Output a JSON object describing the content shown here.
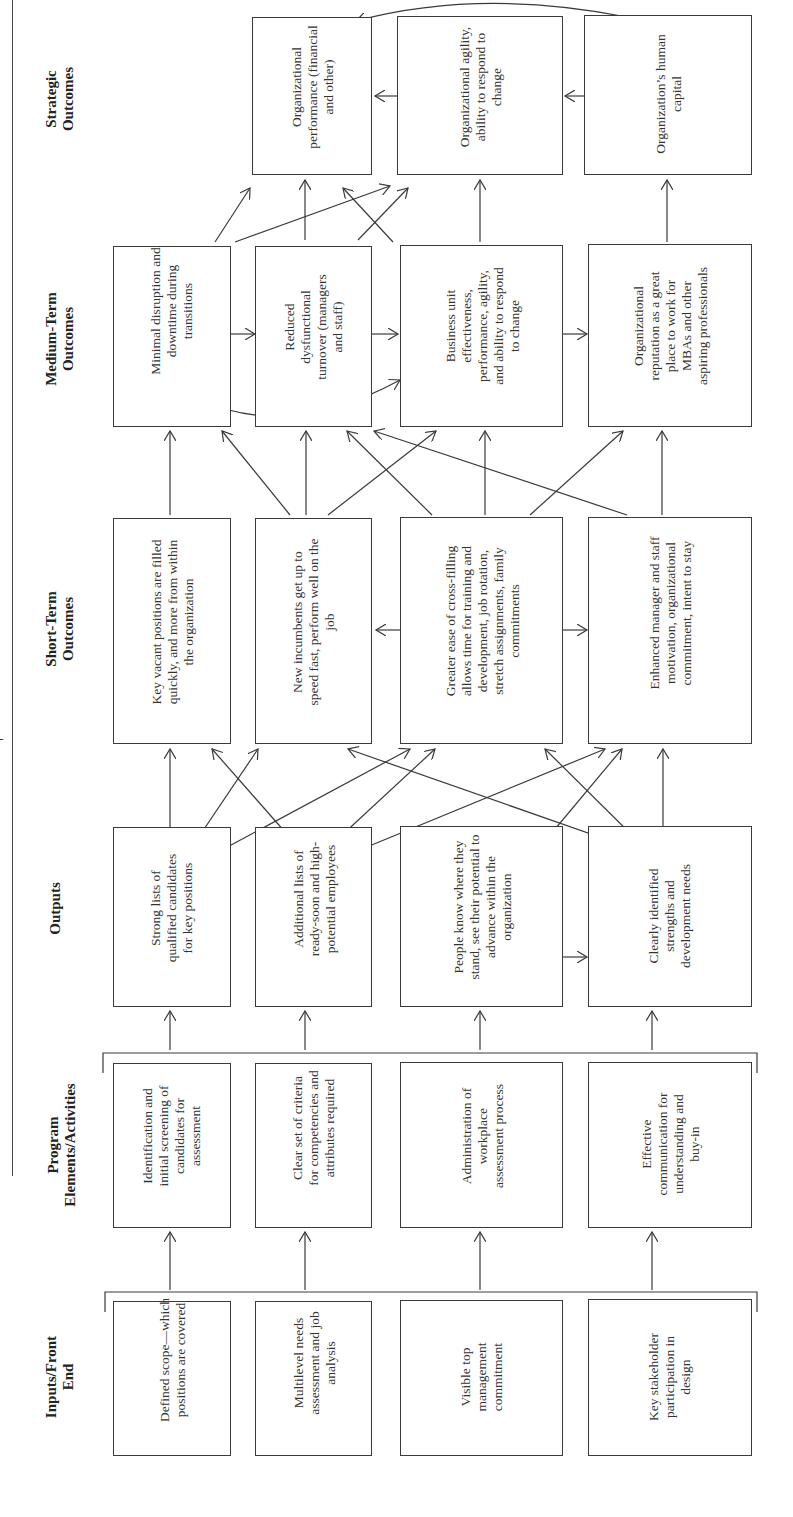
{
  "diagram": {
    "type": "logic-model-flow",
    "orientation": "rotated-90-ccw",
    "columns": [
      {
        "id": "inputs",
        "header": "Inputs/Front End",
        "items": [
          "Defined scope—which positions are covered",
          "Multilevel needs assessment and job analysis",
          "Visible top management commitment",
          "Key stakeholder participation in design"
        ]
      },
      {
        "id": "program",
        "header": "Program Elements/Activities",
        "items": [
          "Identification and initial screening of candidates for assessment",
          "Clear set of criteria for competencies and attributes required",
          "Administration of workplace assessment process",
          "Effective communication for understanding and buy-in"
        ]
      },
      {
        "id": "outputs",
        "header": "Outputs",
        "items": [
          "Strong lists of qualified candidates for key positions",
          "Additional lists of ready-soon and high-potential employees",
          "People know where they stand, see their potential to advance within the organization",
          "Clearly identified strengths and development needs"
        ]
      },
      {
        "id": "short",
        "header": "Short-Term Outcomes",
        "items": [
          "Key vacant positions are filled quickly, and more from within the organization",
          "New incumbents get up to speed fast, perform well on the job",
          "Greater ease of cross-filling allows time for training and development, job rotation, stretch assignments, family commitments",
          "Enhanced manager and staff motivation, organizational commitment, intent to stay"
        ]
      },
      {
        "id": "medium",
        "header": "Medium-Term Outcomes",
        "items": [
          "Minimal disruption and downtime during transitions",
          "Reduced dysfunctional turnover (managers and staff)",
          "Business unit effectiveness, performance, agility, and ability to respond to change",
          "Organizational reputation as a great place to work for MBAs and other aspiring professionals"
        ]
      },
      {
        "id": "strategic",
        "header": "Strategic Outcomes",
        "items": [
          "Organizational performance (financial and other)",
          "Organizational agility, ability to respond to change",
          "Organization’s human capital"
        ]
      }
    ],
    "lines": {
      "inputs": [
        "Defined",
        "scope—which",
        "positions are",
        "covered"
      ]
    }
  },
  "text": {
    "h_inputs_1": "Inputs/Front",
    "h_inputs_2": "End",
    "h_program_1": "Program",
    "h_program_2": "Elements/Activities",
    "h_outputs": "Outputs",
    "h_short_1": "Short-Term",
    "h_short_2": "Outcomes",
    "h_medium_1": "Medium-Term",
    "h_medium_2": "Outcomes",
    "h_strategic_1": "Strategic",
    "h_strategic_2": "Outcomes",
    "in1": "Defined scope—which positions are covered",
    "in2": "Multilevel needs assessment and job analysis",
    "in3": "Visible top management commitment",
    "in4": "Key stakeholder participation in design",
    "pr1": "Identification and initial screening of candidates for assessment",
    "pr2": "Clear set of criteria for competencies and attributes required",
    "pr3": "Administration of workplace assessment process",
    "pr4": "Effective communication for understanding and buy-in",
    "out1": "Strong lists of qualified candidates for key positions",
    "out2": "Additional lists of ready-soon and high-potential employees",
    "out3": "People know where they stand, see their potential to advance within the organization",
    "out4": "Clearly identified strengths and development needs",
    "st1": "Key vacant positions are filled quickly, and more from within the organization",
    "st2": "New incumbents get up to speed fast, perform well on the job",
    "st3": "Greater ease of cross-filling allows time for training and development, job rotation, stretch assignments, family commitments",
    "st4": "Enhanced manager and staff motivation, organizational commitment, intent to stay",
    "md1": "Minimal disruption and downtime during transitions",
    "md2": "Reduced dysfunctional turnover (managers and staff)",
    "md3": "Business unit effectiveness, performance, agility, and ability to respond to change",
    "md4": "Organizational reputation as a great place to work for MBAs and other aspiring professionals",
    "sg1": "Organizational performance (financial and other)",
    "sg2": "Organizational agility, ability to respond to change",
    "sg3": "Organization’s human capital"
  },
  "colors": {
    "line": "#3a3a3a",
    "text": "#333333",
    "background": "#ffffff"
  }
}
